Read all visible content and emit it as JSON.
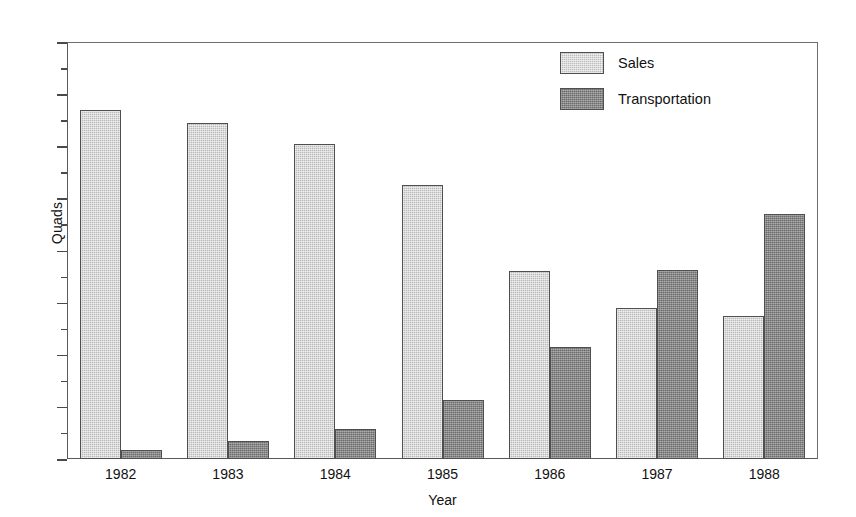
{
  "chart_data": {
    "type": "bar",
    "title": "",
    "xlabel": "Year",
    "ylabel": "Quads",
    "categories": [
      "1982",
      "1983",
      "1984",
      "1985",
      "1986",
      "1987",
      "1988"
    ],
    "series": [
      {
        "name": "Sales",
        "color": "#b9b9b9",
        "values": [
          13.4,
          12.9,
          12.1,
          10.5,
          7.2,
          5.8,
          5.5
        ]
      },
      {
        "name": "Transportation",
        "color": "#6b6b6b",
        "values": [
          0.35,
          0.7,
          1.15,
          2.25,
          4.3,
          7.25,
          9.4
        ]
      }
    ],
    "ylim": [
      0,
      16
    ],
    "y_major_ticks": [
      0,
      2,
      4,
      6,
      8,
      10,
      12,
      14,
      16
    ],
    "y_minor_ticks": [
      1,
      3,
      5,
      7,
      9,
      11,
      13,
      15
    ],
    "y_tick_labels": [
      "0",
      "2",
      "4",
      "6",
      "8",
      "10",
      "12",
      "14",
      "16"
    ],
    "grid": false,
    "legend_position": "top-right"
  },
  "legend": {
    "entries": [
      {
        "label": "Sales"
      },
      {
        "label": "Transportation"
      }
    ]
  },
  "axes": {
    "y_title": "Quads",
    "x_title": "Year"
  }
}
